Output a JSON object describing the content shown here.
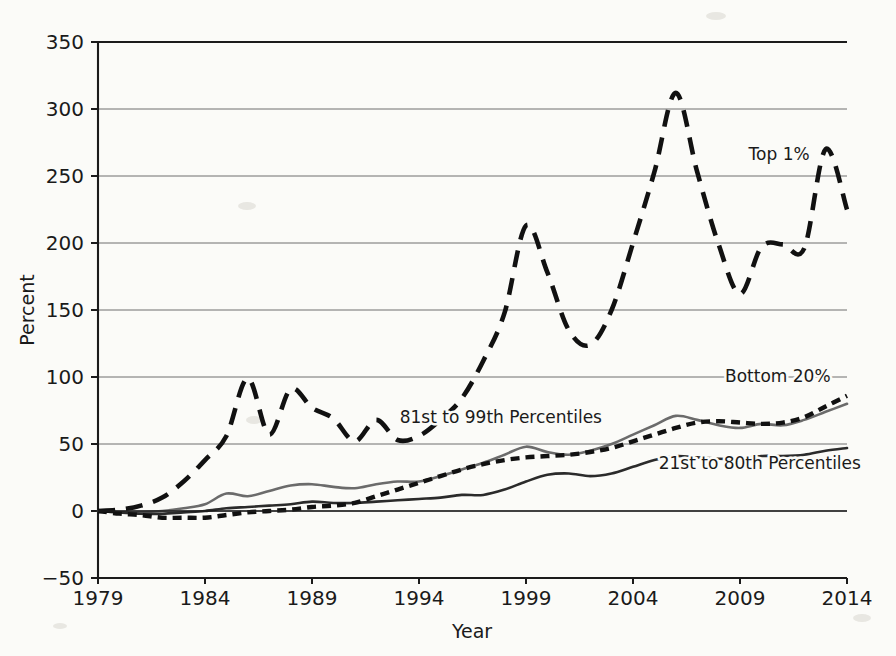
{
  "chart_data": {
    "type": "line",
    "title": "",
    "xlabel": "Year",
    "ylabel": "Percent",
    "xlim": [
      1979,
      2014
    ],
    "ylim": [
      -50,
      350
    ],
    "grid": true,
    "legend_position": "inline-annotations",
    "x_ticks": [
      "1979",
      "1984",
      "1989",
      "1994",
      "1999",
      "2004",
      "2009",
      "2014"
    ],
    "x_tick_values": [
      1979,
      1984,
      1989,
      1994,
      1999,
      2004,
      2009,
      2014
    ],
    "y_ticks": [
      "−50",
      "0",
      "50",
      "100",
      "150",
      "200",
      "250",
      "300",
      "350"
    ],
    "y_tick_values": [
      -50,
      0,
      50,
      100,
      150,
      200,
      250,
      300,
      350
    ],
    "x": [
      1979,
      1980,
      1981,
      1982,
      1983,
      1984,
      1985,
      1986,
      1987,
      1988,
      1989,
      1990,
      1991,
      1992,
      1993,
      1994,
      1995,
      1996,
      1997,
      1998,
      1999,
      2000,
      2001,
      2002,
      2003,
      2004,
      2005,
      2006,
      2007,
      2008,
      2009,
      2010,
      2011,
      2012,
      2013,
      2014
    ],
    "series": [
      {
        "name": "Top 1%",
        "label": "Top 1%",
        "style": "long-dashed",
        "color": "#111111",
        "values": [
          0,
          1,
          4,
          10,
          22,
          38,
          56,
          99,
          57,
          91,
          77,
          69,
          52,
          68,
          53,
          56,
          68,
          84,
          112,
          148,
          213,
          178,
          135,
          124,
          150,
          200,
          253,
          312,
          253,
          199,
          162,
          197,
          199,
          196,
          270,
          225
        ]
      },
      {
        "name": "81st to 99th Percentiles",
        "label": "81st to 99th Percentiles",
        "style": "solid-gray",
        "color": "#6b6b6b",
        "values": [
          0,
          -1,
          -1,
          0,
          2,
          5,
          13,
          11,
          15,
          19,
          20,
          18,
          17,
          20,
          22,
          22,
          26,
          31,
          36,
          42,
          48,
          44,
          42,
          45,
          50,
          57,
          64,
          71,
          68,
          64,
          62,
          65,
          64,
          68,
          74,
          80
        ]
      },
      {
        "name": "Bottom 20%",
        "label": "Bottom 20%",
        "style": "short-dashed",
        "color": "#111111",
        "values": [
          0,
          -2,
          -3,
          -5,
          -5,
          -5,
          -3,
          -1,
          0,
          1,
          3,
          4,
          6,
          11,
          16,
          21,
          26,
          31,
          35,
          38,
          40,
          41,
          42,
          44,
          47,
          52,
          57,
          62,
          66,
          67,
          66,
          65,
          66,
          70,
          78,
          86
        ]
      },
      {
        "name": "21st to 80th Percentiles",
        "label": "21st to 80th Percentiles",
        "style": "solid-dark",
        "color": "#2b2b2b",
        "values": [
          0,
          -1,
          -2,
          -2,
          -1,
          0,
          2,
          3,
          4,
          5,
          7,
          6,
          6,
          7,
          8,
          9,
          10,
          12,
          12,
          16,
          22,
          27,
          28,
          26,
          28,
          33,
          38,
          41,
          40,
          39,
          39,
          41,
          41,
          42,
          45,
          47
        ]
      }
    ],
    "annotations": [
      {
        "text": "Top 1%",
        "x": 2009.4,
        "y": 262
      },
      {
        "text": "Bottom 20%",
        "x": 2008.3,
        "y": 96
      },
      {
        "text": "81st to 99th Percentiles",
        "x": 1993.1,
        "y": 66
      },
      {
        "text": "21st to 80th Percentiles",
        "x": 2005.2,
        "y": 31
      }
    ]
  }
}
